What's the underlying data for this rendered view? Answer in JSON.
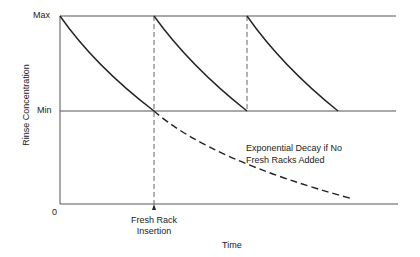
{
  "diagram": {
    "y_axis_label": "Rinse Concentration",
    "x_axis_label": "Time",
    "y_ticks": {
      "max": "Max",
      "min": "Min",
      "zero": "0"
    },
    "annotation_decay_line1": "Exponential Decay if No",
    "annotation_decay_line2": "Fresh Racks Added",
    "marker_label_line1": "Fresh Rack",
    "marker_label_line2": "Insertion",
    "colors": {
      "line": "#222222",
      "dashed": "#555555"
    }
  }
}
